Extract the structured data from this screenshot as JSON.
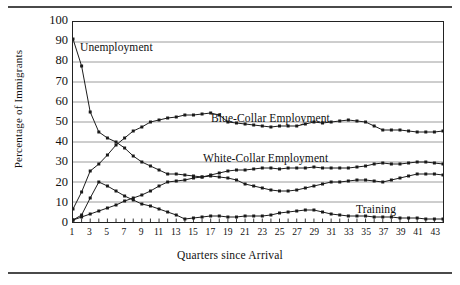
{
  "chart_data": {
    "type": "line",
    "title": "",
    "xlabel": "Quarters since Arrival",
    "ylabel": "Percentage of Immigrants",
    "xlim": [
      1,
      44
    ],
    "ylim": [
      0,
      100
    ],
    "ytick_values": [
      0,
      10,
      20,
      30,
      40,
      50,
      60,
      70,
      80,
      90,
      100
    ],
    "ytick_labels": [
      "0",
      "10",
      "20",
      "30",
      "40",
      "50",
      "60",
      "70",
      "80",
      "90",
      "100"
    ],
    "xtick_values": [
      1,
      3,
      5,
      7,
      9,
      11,
      13,
      15,
      17,
      19,
      21,
      23,
      25,
      27,
      29,
      31,
      33,
      35,
      37,
      39,
      41,
      43
    ],
    "xtick_labels": [
      "1",
      "3",
      "5",
      "7",
      "9",
      "11",
      "13",
      "15",
      "17",
      "19",
      "21",
      "23",
      "25",
      "27",
      "29",
      "31",
      "33",
      "35",
      "37",
      "39",
      "41",
      "43"
    ],
    "grid": "horizontal",
    "legend_position": "inline-annotations",
    "x": [
      1,
      2,
      3,
      4,
      5,
      6,
      7,
      8,
      9,
      10,
      11,
      12,
      13,
      14,
      15,
      16,
      17,
      18,
      19,
      20,
      21,
      22,
      23,
      24,
      25,
      26,
      27,
      28,
      29,
      30,
      31,
      32,
      33,
      34,
      35,
      36,
      37,
      38,
      39,
      40,
      41,
      42,
      43,
      44
    ],
    "series": [
      {
        "name": "Unemployment",
        "color": "#1a1a1a",
        "marker": "square",
        "values": [
          91.5,
          78,
          55,
          45,
          42,
          40,
          37,
          33,
          30,
          28,
          26,
          24,
          24,
          23.5,
          23,
          22.5,
          23,
          22.5,
          22,
          21,
          19,
          18,
          17,
          16,
          15.5,
          15.5,
          16,
          17,
          18,
          19,
          20,
          20,
          20.5,
          21,
          21,
          20.5,
          20,
          21,
          22,
          23,
          24,
          24,
          24,
          23.5
        ]
      },
      {
        "name": "Blue-Collar Employment",
        "color": "#1a1a1a",
        "marker": "square",
        "values": [
          6.5,
          15,
          25.5,
          29,
          33.5,
          38.5,
          42,
          45.5,
          47.5,
          50,
          51,
          52,
          52.5,
          53.5,
          53.5,
          54,
          54.5,
          53.5,
          50,
          49.5,
          49,
          48.5,
          48,
          47.5,
          48,
          48,
          48,
          49,
          50,
          49.5,
          50,
          50.5,
          51,
          50.5,
          50,
          48,
          46,
          46,
          46,
          45.5,
          45,
          45,
          45,
          45.5
        ]
      },
      {
        "name": "White-Collar Employment",
        "color": "#1a1a1a",
        "marker": "square",
        "values": [
          1,
          2.5,
          4,
          5.5,
          7,
          8.5,
          10.5,
          12,
          13.5,
          15.5,
          18,
          20,
          20.5,
          21,
          22,
          22.5,
          23.5,
          24.5,
          25.5,
          26,
          26,
          26.5,
          27,
          27,
          26.5,
          27,
          27,
          27,
          27.5,
          27,
          27,
          27,
          27,
          27.5,
          28,
          29,
          29.5,
          29,
          29,
          29.5,
          30,
          30,
          29.5,
          29
        ]
      },
      {
        "name": "Training",
        "color": "#1a1a1a",
        "marker": "square",
        "values": [
          1,
          3.5,
          12,
          20,
          18,
          15.5,
          13,
          11,
          9,
          8,
          6.5,
          5,
          3.5,
          1.5,
          2,
          2.5,
          3,
          3,
          2.5,
          2.5,
          3,
          3,
          3,
          3.5,
          4.5,
          5,
          5.5,
          6,
          6,
          5,
          4,
          3.5,
          3,
          3,
          3,
          2.5,
          2.5,
          2.5,
          2,
          2,
          2,
          1.5,
          1.5,
          1.5
        ]
      }
    ],
    "annotations": [
      {
        "text": "Unemployment",
        "x_px": 80,
        "y_px": 41
      },
      {
        "text": "Blue-Collar Employment",
        "x_px": 211,
        "y_px": 112
      },
      {
        "text": "White-Collar Employment",
        "x_px": 203,
        "y_px": 152
      },
      {
        "text": "Training",
        "x_px": 356,
        "y_px": 203
      }
    ]
  }
}
